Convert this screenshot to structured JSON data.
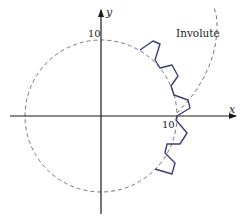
{
  "figure": {
    "axes": {
      "x_label": "x",
      "y_label": "y",
      "x_tick_label": "10",
      "y_tick_label": "10"
    },
    "annotations": {
      "involute_label": "Involute"
    },
    "colors": {
      "gear_curve": "#3a3f7a",
      "axes": "#1a1a1a",
      "dashed": "#555555"
    },
    "elements": [
      "base circle (dashed, radius 10)",
      "involute curve (dashed)",
      "gear tooth profile (solid blue)"
    ]
  }
}
